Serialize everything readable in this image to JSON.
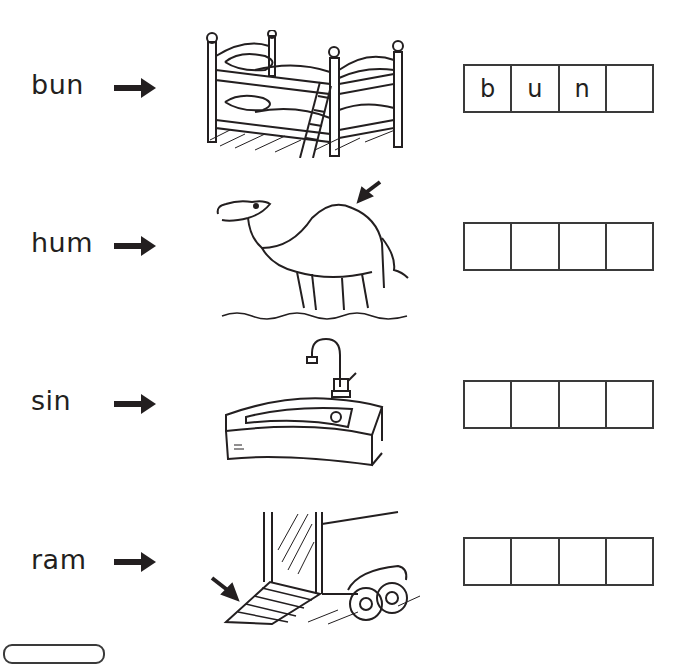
{
  "worksheet": {
    "rows": [
      {
        "word": "bun",
        "picture": "bunk-bed",
        "boxes": [
          "b",
          "u",
          "n",
          ""
        ]
      },
      {
        "word": "hum",
        "picture": "camel-hump",
        "boxes": [
          "",
          "",
          "",
          ""
        ]
      },
      {
        "word": "sin",
        "picture": "sink",
        "boxes": [
          "",
          "",
          "",
          ""
        ]
      },
      {
        "word": "ram",
        "picture": "trailer-ramp",
        "boxes": [
          "",
          "",
          "",
          ""
        ]
      }
    ]
  },
  "colors": {
    "ink": "#231f20",
    "box_border": "#3a3a3a",
    "background": "#ffffff"
  }
}
